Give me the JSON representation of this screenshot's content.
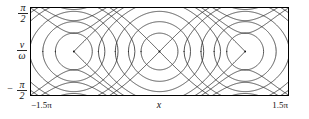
{
  "figure": {
    "kind": "phase-portrait",
    "background": "#ffffff",
    "curve_color": "#2b2b2b",
    "frame_color": "#000000"
  },
  "axes": {
    "x_label": "x",
    "x_tick_left": "−1.5π",
    "x_tick_right": "1.5π",
    "y_label_num": "v",
    "y_label_den": "ω",
    "y_tick_top_num": "π",
    "y_tick_top_den": "2",
    "y_tick_bottom_sign": "−",
    "y_tick_bottom_num": "π",
    "y_tick_bottom_den": "2"
  },
  "chart_data": {
    "type": "line",
    "title": "",
    "xlabel": "x",
    "ylabel": "v/ω",
    "xlim": [
      -4.71238898038469,
      4.71238898038469
    ],
    "ylim": [
      -1.570796326794897,
      1.570796326794897
    ],
    "xtick_labels": [
      "−1.5π",
      "1.5π"
    ],
    "ytick_labels": [
      "−π/2",
      "π/2"
    ],
    "grid": false,
    "legend": null,
    "centers_x": [
      -3.141592653589793,
      0.0,
      3.141592653589793
    ],
    "centers_y": [
      0.0,
      0.0,
      0.0
    ],
    "xpoints_x": [
      -4.71238898038469,
      -1.570796326794897,
      1.570796326794897,
      4.71238898038469
    ],
    "xpoints_y": [
      0.0,
      0.0,
      0.0,
      0.0
    ],
    "separatrix_level": 1.0,
    "libration_levels": [
      -0.78,
      -0.42,
      0.05,
      0.62
    ],
    "circulation_levels": [
      1.22,
      1.62,
      2.15,
      2.8
    ],
    "series": [
      {
        "name": "libration-orbit-1",
        "level": -0.78,
        "closed": true
      },
      {
        "name": "libration-orbit-2",
        "level": -0.42,
        "closed": true
      },
      {
        "name": "libration-orbit-3",
        "level": 0.05,
        "closed": true
      },
      {
        "name": "libration-orbit-4",
        "level": 0.62,
        "closed": true
      },
      {
        "name": "separatrix",
        "level": 1.0,
        "closed": false
      },
      {
        "name": "circulation-upper-1",
        "level": 1.22,
        "closed": false
      },
      {
        "name": "circulation-upper-2",
        "level": 1.62,
        "closed": false
      },
      {
        "name": "circulation-upper-3",
        "level": 2.15,
        "closed": false
      },
      {
        "name": "circulation-upper-4",
        "level": 2.8,
        "closed": false
      },
      {
        "name": "circulation-lower-1",
        "level": 1.22,
        "closed": false
      },
      {
        "name": "circulation-lower-2",
        "level": 1.62,
        "closed": false
      },
      {
        "name": "circulation-lower-3",
        "level": 2.15,
        "closed": false
      },
      {
        "name": "circulation-lower-4",
        "level": 2.8,
        "closed": false
      }
    ]
  }
}
